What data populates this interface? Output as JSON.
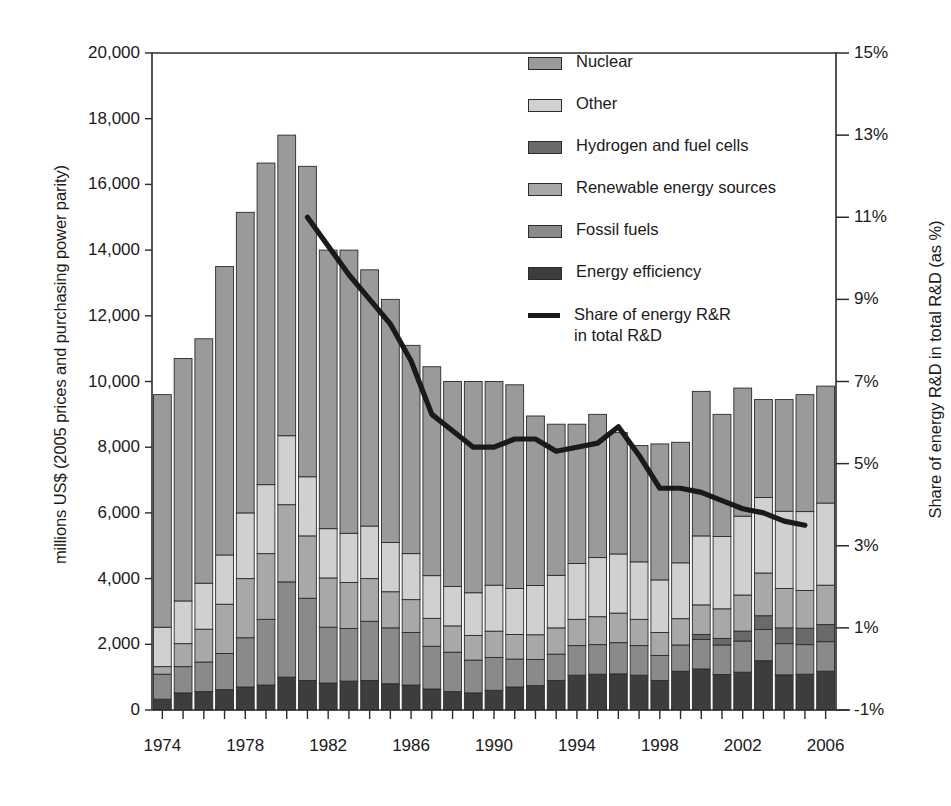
{
  "chart_data": {
    "type": "bar",
    "subtype": "stacked-bar-with-line-overlay",
    "title": "",
    "xlabel": "",
    "ylabel": "millions US$ (2005 prices and purchasing power parity)",
    "y2label": "Share of energy R&D in total R&D (as %)",
    "ylim": [
      0,
      20000
    ],
    "y2lim": [
      -1,
      15
    ],
    "ytick_labels": [
      "20,000",
      "18,000",
      "16,000",
      "14,000",
      "12,000",
      "10,000",
      "8,000",
      "6,000",
      "4,000",
      "2,000",
      "0"
    ],
    "ytick_values": [
      20000,
      18000,
      16000,
      14000,
      12000,
      10000,
      8000,
      6000,
      4000,
      2000,
      0
    ],
    "y2tick_labels": [
      "15%",
      "13%",
      "11%",
      "9%",
      "7%",
      "5%",
      "3%",
      "1%",
      "-1%"
    ],
    "y2tick_values": [
      15,
      13,
      11,
      9,
      7,
      5,
      3,
      1,
      -1
    ],
    "grid": false,
    "legend_position": "top-right-inside",
    "categories": [
      1974,
      1975,
      1976,
      1977,
      1978,
      1979,
      1980,
      1981,
      1982,
      1983,
      1984,
      1985,
      1986,
      1987,
      1988,
      1989,
      1990,
      1991,
      1992,
      1993,
      1994,
      1995,
      1996,
      1997,
      1998,
      1999,
      2000,
      2001,
      2002,
      2003,
      2004,
      2005,
      2006
    ],
    "xtick_labels": [
      "1974",
      "1978",
      "1982",
      "1986",
      "1990",
      "1994",
      "1998",
      "2002",
      "2006"
    ],
    "xtick_values": [
      1974,
      1978,
      1982,
      1986,
      1990,
      1994,
      1998,
      2002,
      2006
    ],
    "stack_order_bottom_to_top": [
      "Energy efficiency",
      "Fossil fuels",
      "Hydrogen and fuel cells",
      "Renewable energy sources",
      "Other",
      "Nuclear"
    ],
    "series": [
      {
        "name": "Energy efficiency",
        "color": "#3d3d3d",
        "values": [
          330,
          520,
          560,
          620,
          700,
          760,
          1000,
          900,
          820,
          880,
          900,
          800,
          760,
          640,
          560,
          520,
          600,
          700,
          740,
          900,
          1060,
          1090,
          1100,
          1060,
          900,
          1180,
          1250,
          1080,
          1150,
          1500,
          1070,
          1090,
          1180
        ]
      },
      {
        "name": "Fossil fuels",
        "color": "#8a8a8a",
        "values": [
          760,
          800,
          900,
          1100,
          1500,
          2000,
          2900,
          2500,
          1700,
          1600,
          1800,
          1700,
          1600,
          1300,
          1200,
          1000,
          1000,
          850,
          800,
          800,
          900,
          900,
          950,
          900,
          760,
          800,
          900,
          900,
          950,
          950,
          950,
          900,
          900
        ]
      },
      {
        "name": "Hydrogen and fuel cells",
        "color": "#6a6a6a",
        "values": [
          0,
          0,
          0,
          0,
          0,
          0,
          0,
          0,
          0,
          0,
          0,
          0,
          0,
          0,
          0,
          0,
          0,
          0,
          0,
          0,
          0,
          0,
          0,
          0,
          0,
          0,
          150,
          200,
          300,
          420,
          480,
          500,
          520
        ]
      },
      {
        "name": "Renewable energy sources",
        "color": "#a8a8a8",
        "values": [
          230,
          700,
          1000,
          1500,
          1800,
          2000,
          2350,
          1900,
          1500,
          1400,
          1300,
          1100,
          1000,
          850,
          800,
          750,
          800,
          750,
          750,
          800,
          800,
          850,
          900,
          800,
          700,
          800,
          900,
          900,
          1100,
          1300,
          1200,
          1150,
          1200
        ]
      },
      {
        "name": "Other",
        "color": "#d0d0d0",
        "values": [
          1200,
          1300,
          1400,
          1500,
          2000,
          2100,
          2100,
          1800,
          1500,
          1500,
          1600,
          1500,
          1400,
          1300,
          1200,
          1300,
          1400,
          1400,
          1500,
          1600,
          1700,
          1800,
          1800,
          1750,
          1600,
          1700,
          2100,
          2200,
          2400,
          2300,
          2350,
          2400,
          2500
        ]
      },
      {
        "name": "Nuclear",
        "color": "#9a9a9a",
        "values": [
          7080,
          7380,
          7440,
          8780,
          9150,
          9790,
          9150,
          9450,
          8480,
          8620,
          7800,
          7400,
          6340,
          6360,
          6240,
          6430,
          6200,
          6200,
          5160,
          4600,
          4240,
          4360,
          3700,
          3540,
          4140,
          3670,
          4400,
          3720,
          3900,
          2980,
          3400,
          3560,
          3560
        ]
      }
    ],
    "totals": [
      9600,
      10700,
      11300,
      13500,
      15150,
      16650,
      17500,
      16550,
      15000,
      14000,
      13400,
      12500,
      11100,
      10450,
      10000,
      10000,
      10000,
      9900,
      8950,
      8700,
      8700,
      9000,
      8450,
      8050,
      8100,
      8150,
      9700,
      9000,
      9800,
      9450,
      9450,
      9600,
      9860
    ],
    "line_series": {
      "name": "Share of energy R&R in total R&D",
      "color": "#1a1a1a",
      "units": "%",
      "axis": "right",
      "x": [
        1981,
        1982,
        1983,
        1984,
        1985,
        1986,
        1987,
        1988,
        1989,
        1990,
        1991,
        1992,
        1993,
        1994,
        1995,
        1996,
        1997,
        1998,
        1999,
        2000,
        2001,
        2002,
        2003,
        2004,
        2005
      ],
      "values": [
        11.0,
        10.3,
        9.6,
        9.0,
        8.4,
        7.5,
        6.2,
        5.8,
        5.4,
        5.4,
        5.6,
        5.6,
        5.3,
        5.4,
        5.5,
        5.9,
        5.2,
        4.4,
        4.4,
        4.3,
        4.1,
        3.9,
        3.8,
        3.6,
        3.5
      ]
    },
    "legend": [
      {
        "label": "Nuclear",
        "color": "#9a9a9a",
        "type": "swatch"
      },
      {
        "label": "Other",
        "color": "#d0d0d0",
        "type": "swatch"
      },
      {
        "label": "Hydrogen and fuel cells",
        "color": "#6a6a6a",
        "type": "swatch"
      },
      {
        "label": "Renewable energy sources",
        "color": "#a8a8a8",
        "type": "swatch"
      },
      {
        "label": "Fossil fuels",
        "color": "#8a8a8a",
        "type": "swatch"
      },
      {
        "label": "Energy efficiency",
        "color": "#3d3d3d",
        "type": "swatch"
      },
      {
        "label": "Share of energy R&R in total R&D",
        "color": "#1a1a1a",
        "type": "line"
      }
    ]
  }
}
